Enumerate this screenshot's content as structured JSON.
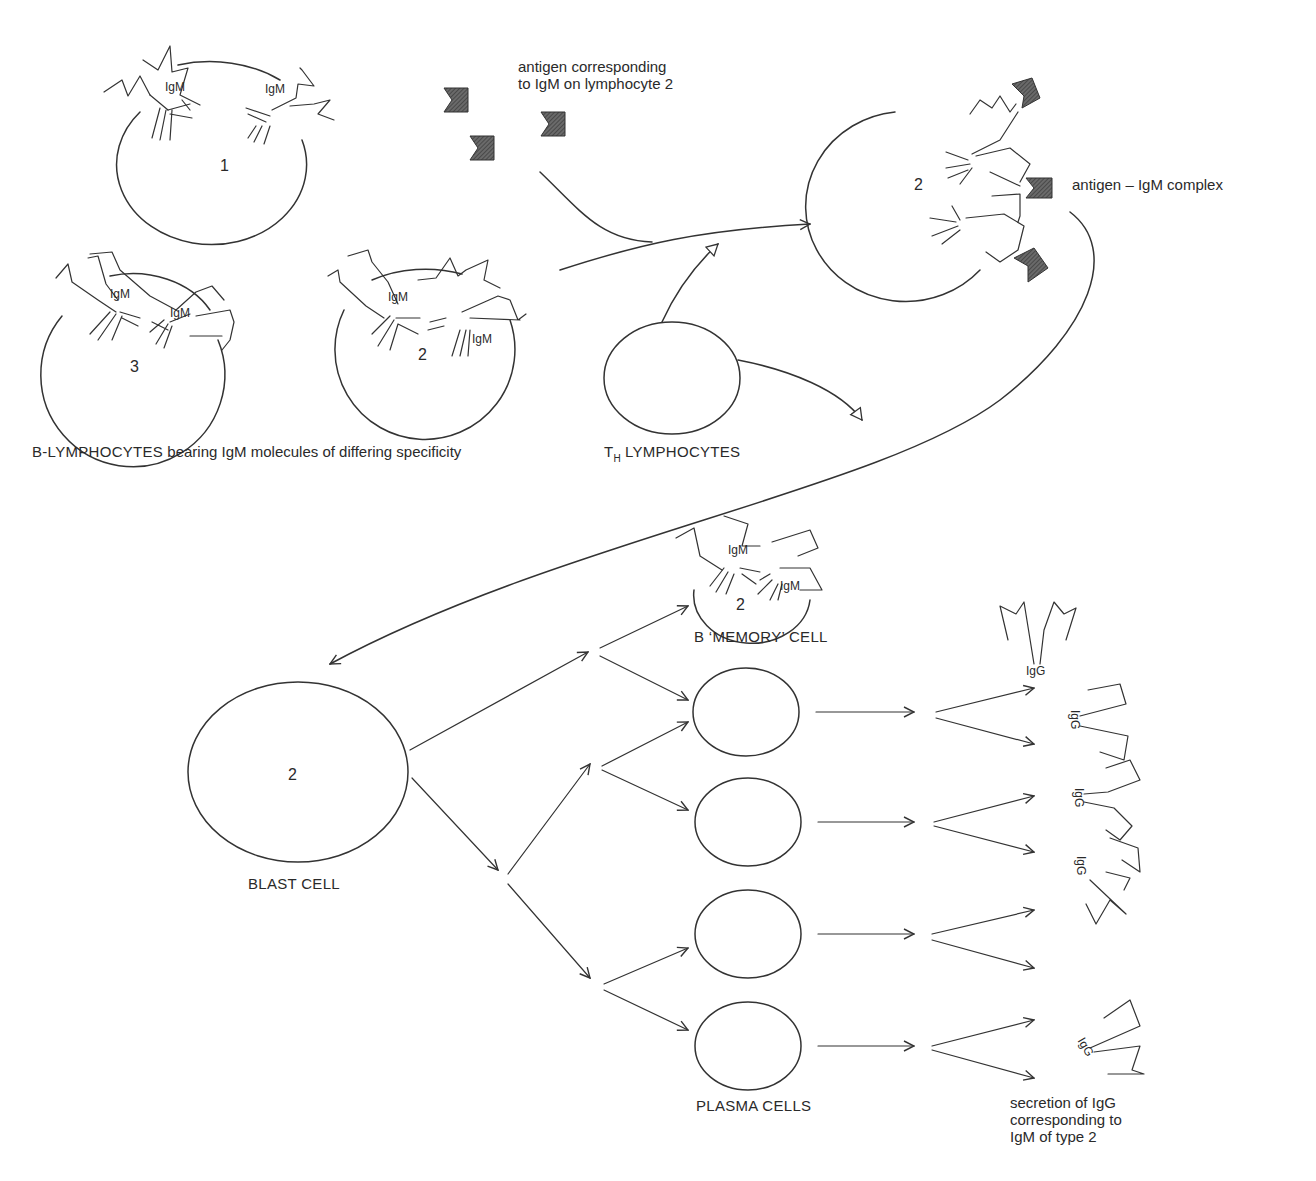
{
  "diagram": {
    "type": "immunology flow diagram",
    "labels": {
      "antigen_note": "antigen corresponding\nto IgM on lymphocyte 2",
      "antigen_complex": "antigen – IgM complex",
      "b_lymphocytes_caps": "B-LYMPHOCYTES",
      "b_lymphocytes_rest": "bearing IgM molecules of differing specificity",
      "th_prefix": "T",
      "th_sub": "H",
      "th_rest": "LYMPHOCYTES",
      "memory_cell": "B ‘MEMORY’ CELL",
      "blast_cell": "BLAST CELL",
      "plasma_cells": "PLASMA CELLS",
      "secretion_note": "secretion of IgG\ncorresponding to\nIgM of type 2"
    },
    "cell_numbers": {
      "cell1": "1",
      "cell3": "3",
      "cell2_unbound": "2",
      "cell2_complex": "2",
      "memory": "2",
      "blast": "2"
    },
    "antibody_labels": {
      "igm": "IgM",
      "igg": "IgG"
    },
    "nodes": [
      {
        "id": "b1",
        "label": "B-lymphocyte 1"
      },
      {
        "id": "b3",
        "label": "B-lymphocyte 3"
      },
      {
        "id": "b2",
        "label": "B-lymphocyte 2"
      },
      {
        "id": "antigen",
        "label": "antigen"
      },
      {
        "id": "th",
        "label": "TH lymphocyte"
      },
      {
        "id": "complex",
        "label": "antigen – IgM complex (cell 2)"
      },
      {
        "id": "blast",
        "label": "blast cell"
      },
      {
        "id": "memory",
        "label": "B memory cell"
      },
      {
        "id": "plasma1",
        "label": "plasma cell"
      },
      {
        "id": "plasma2",
        "label": "plasma cell"
      },
      {
        "id": "plasma3",
        "label": "plasma cell"
      },
      {
        "id": "plasma4",
        "label": "plasma cell"
      },
      {
        "id": "igg",
        "label": "secreted IgG"
      }
    ],
    "edges": [
      {
        "from": "antigen",
        "to": "complex"
      },
      {
        "from": "b2",
        "to": "complex"
      },
      {
        "from": "th",
        "to": "complex"
      },
      {
        "from": "th",
        "to": "blast"
      },
      {
        "from": "complex",
        "to": "blast"
      },
      {
        "from": "blast",
        "to": "memory"
      },
      {
        "from": "blast",
        "to": "plasma1"
      },
      {
        "from": "blast",
        "to": "plasma2"
      },
      {
        "from": "blast",
        "to": "plasma3"
      },
      {
        "from": "blast",
        "to": "plasma4"
      },
      {
        "from": "plasma1",
        "to": "igg"
      },
      {
        "from": "plasma2",
        "to": "igg"
      },
      {
        "from": "plasma3",
        "to": "igg"
      },
      {
        "from": "plasma4",
        "to": "igg"
      }
    ]
  }
}
